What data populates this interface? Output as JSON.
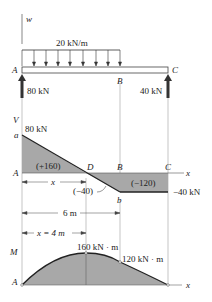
{
  "load_diagram": {
    "axis_label": "w",
    "distributed_load": "20 kN/m",
    "points": {
      "A": "A",
      "B": "B",
      "C": "C"
    },
    "reaction_A": "80 kN",
    "reaction_C": "40 kN"
  },
  "shear_diagram": {
    "axis_label": "V",
    "x_label": "x",
    "point_a": "a",
    "point_b": "b",
    "point_D": "D",
    "point_A": "A",
    "point_B": "B",
    "point_C": "C",
    "value_start": "80 kN",
    "value_end": "−40 kN",
    "area_positive": "(+160)",
    "area_neg_small": "(−40)",
    "area_neg_large": "(−120)",
    "dim_x": "x"
  },
  "dimensions": {
    "span_6m": "6 m",
    "x_eq_4m": "x = 4 m"
  },
  "moment_diagram": {
    "axis_label": "M",
    "x_label": "x",
    "point_A": "A",
    "max_moment": "160 kN · m",
    "moment_at_B": "120 kN · m"
  },
  "colors": {
    "fill": "#a8a8a8",
    "line": "#333333",
    "arrow": "#444444"
  }
}
